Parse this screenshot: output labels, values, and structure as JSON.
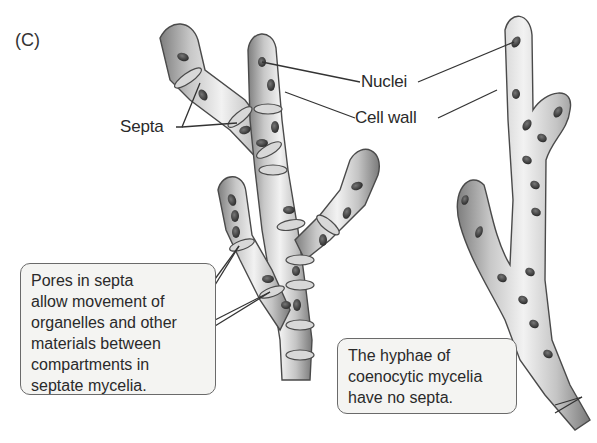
{
  "figure": {
    "panel_label": "(C)",
    "labels": {
      "nuclei": "Nuclei",
      "cell_wall": "Cell wall",
      "septa": "Septa"
    },
    "callouts": {
      "septate": {
        "lines": [
          "Pores in septa",
          "allow movement of",
          "organelles and other",
          "materials between",
          "compartments in",
          "septate mycelia."
        ]
      },
      "coenocytic": {
        "lines": [
          "The hyphae of",
          "coenocytic mycelia",
          "have no septa."
        ]
      }
    },
    "colors": {
      "hypha_light": "#ececec",
      "hypha_mid": "#b8b8b8",
      "hypha_dark": "#7a7a7a",
      "outline": "#4a4a4a",
      "nucleus": "#3a3a3a",
      "callout_bg": "#f4f4f2",
      "callout_border": "#6a6a6a"
    }
  }
}
